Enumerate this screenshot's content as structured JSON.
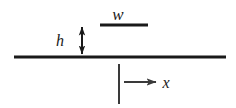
{
  "figure": {
    "background_color": "#ffffff",
    "line_color": "#1a1a1a",
    "thin_line_color": "#3a3a3a",
    "width": 236,
    "height": 108
  },
  "labels": {
    "width_symbol": "w",
    "height_symbol": "h",
    "axis_symbol": "x"
  },
  "geometry": {
    "baseline": {
      "name": "substrate-surface-line",
      "x1": 14,
      "x2": 226,
      "y": 57,
      "thickness": 3
    },
    "top_bar": {
      "name": "feature-width-bar",
      "x1": 100,
      "x2": 148,
      "y": 25,
      "thickness": 3
    },
    "height_arrow": {
      "name": "height-double-arrow",
      "x": 82,
      "y_top": 26,
      "y_bottom": 55,
      "thickness": 2,
      "double_headed": true
    },
    "axis_tick": {
      "name": "origin-tick-line",
      "x": 119,
      "y1": 64,
      "y2": 104,
      "thickness": 2
    },
    "axis_arrow": {
      "name": "x-axis-arrow",
      "x1": 124,
      "x2": 158,
      "y": 82,
      "thickness": 2,
      "double_headed": false
    }
  },
  "label_positions": {
    "w": {
      "x": 118,
      "y": 20
    },
    "h": {
      "x": 60,
      "y": 46
    },
    "x": {
      "x": 166,
      "y": 88
    }
  }
}
